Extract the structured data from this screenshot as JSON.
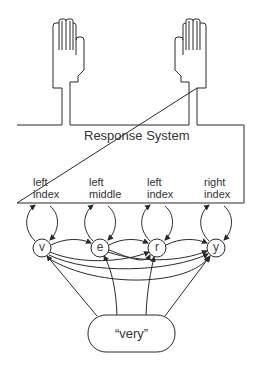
{
  "diagram": {
    "response_system": {
      "title": "Response System",
      "finger_labels": [
        {
          "line1": "left",
          "line2": "index"
        },
        {
          "line1": "left",
          "line2": "middle"
        },
        {
          "line1": "left",
          "line2": "index"
        },
        {
          "line1": "right",
          "line2": "index"
        }
      ]
    },
    "hands": [
      {
        "name": "left-hand",
        "side": "left"
      },
      {
        "name": "right-hand",
        "side": "right"
      }
    ],
    "letter_nodes": [
      "v",
      "e",
      "r",
      "y"
    ],
    "word_node": {
      "label": "“very”"
    },
    "stroke_color": "#2a2a2a"
  }
}
